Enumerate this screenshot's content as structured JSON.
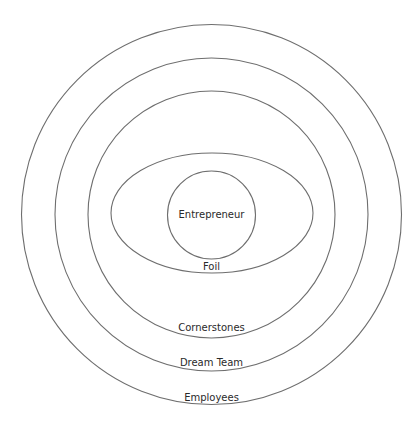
{
  "diagram": {
    "type": "concentric-circles",
    "layers": [
      {
        "label": "Entrepreneur",
        "shape": "circle",
        "level": 1
      },
      {
        "label": "Foil",
        "shape": "ellipse",
        "level": 2
      },
      {
        "label": "Cornerstones",
        "shape": "circle",
        "level": 3
      },
      {
        "label": "Dream Team",
        "shape": "circle",
        "level": 4
      },
      {
        "label": "Employees",
        "shape": "circle",
        "level": 5
      }
    ],
    "colors": {
      "stroke": "#6e6e6e",
      "text": "#2a2a2a",
      "background": "#ffffff"
    }
  }
}
